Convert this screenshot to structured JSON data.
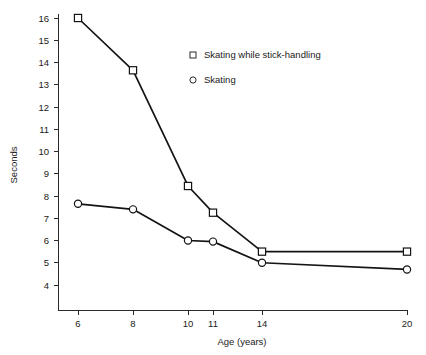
{
  "chart_data": {
    "type": "line",
    "title": "",
    "subtitle": "",
    "xlabel": "Age (years)",
    "ylabel": "Seconds",
    "categories": [
      "6",
      "8",
      "10",
      "11",
      "14",
      "20"
    ],
    "x": [
      6,
      8,
      10,
      11,
      14,
      20
    ],
    "xtick_labels": [
      "6",
      "8",
      "10",
      "11",
      "14",
      "20"
    ],
    "ytick_labels": [
      "4",
      "5",
      "6",
      "7",
      "8",
      "9",
      "10",
      "11",
      "12",
      "13",
      "14",
      "15",
      "16"
    ],
    "ylim": [
      3.3,
      16.0
    ],
    "xlim_note": "ordinal spacing; ticks positioned proportional to age",
    "grid": false,
    "legend_position": "upper-center-right",
    "series": [
      {
        "name": "Skating while stick-handling",
        "marker": "open-square",
        "values": [
          16.0,
          13.65,
          8.45,
          7.25,
          5.5,
          5.5
        ]
      },
      {
        "name": "Skating",
        "marker": "open-circle",
        "values": [
          7.65,
          7.4,
          6.0,
          5.95,
          5.0,
          4.7
        ]
      }
    ]
  },
  "legend": {
    "entries": [
      {
        "label": "Skating while stick-handling",
        "marker": "square-marker-icon"
      },
      {
        "label": "Skating",
        "marker": "circle-marker-icon"
      }
    ]
  },
  "axes": {
    "y_title": "Seconds",
    "x_title": "Age (years)"
  },
  "colors": {
    "line": "#141414",
    "axis": "#2b2b2b",
    "marker_fill": "#ffffff",
    "background": "#ffffff"
  }
}
